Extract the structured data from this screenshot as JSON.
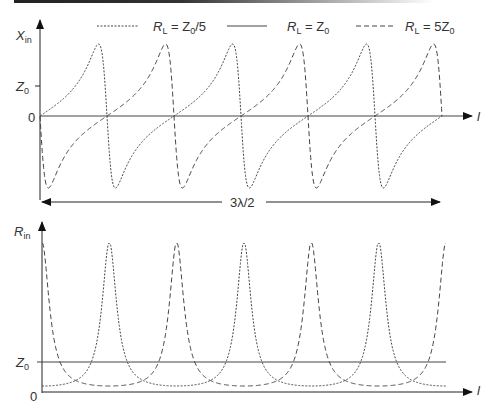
{
  "chart_data": [
    {
      "type": "line",
      "title": "",
      "ylabel": "X_in",
      "ylabel_main": "X",
      "ylabel_sub": "in",
      "xlabel": "l",
      "y_ticks": [
        "Z0",
        "0"
      ],
      "span_label": "3λ/2",
      "legend_position": "top",
      "series": [
        {
          "name": "R_L = Z0/5",
          "style": "dotted",
          "shape": "tan-like: rises from 0, peaks then plunges to negative minimum, repeating every λ/4... period λ/2",
          "peak": 2.4,
          "min": -2.4,
          "periods": 3
        },
        {
          "name": "R_L = Z0",
          "style": "solid",
          "value": 0
        },
        {
          "name": "R_L = 5Z0",
          "style": "dashed",
          "shape": "starts at 0, dips to negative minimum, rises gradually to positive peak, plunges; period λ/2",
          "peak": 2.4,
          "min": -2.4,
          "periods": 3
        }
      ]
    },
    {
      "type": "line",
      "title": "",
      "ylabel": "R_in",
      "ylabel_main": "R",
      "ylabel_sub": "in",
      "xlabel": "l",
      "y_ticks": [
        "Z0",
        "0"
      ],
      "series": [
        {
          "name": "R_L = Z0/5",
          "style": "dotted",
          "min": 0.2,
          "max": 5.0,
          "periods": 3
        },
        {
          "name": "R_L = Z0",
          "style": "solid",
          "value": 1.0
        },
        {
          "name": "R_L = 5Z0",
          "style": "dashed",
          "min": 0.2,
          "max": 5.0,
          "periods": 3
        }
      ]
    }
  ],
  "legend": {
    "items": [
      {
        "label_pre": "R",
        "label_sub": "L",
        "label_post": " = Z",
        "label_sub2": "0",
        "label_tail": "/5"
      },
      {
        "label_pre": "R",
        "label_sub": "L",
        "label_post": " = Z",
        "label_sub2": "0",
        "label_tail": ""
      },
      {
        "label_pre": "R",
        "label_sub": "L",
        "label_post": " = 5Z",
        "label_sub2": "0",
        "label_tail": ""
      }
    ]
  },
  "top": {
    "y_label": "X",
    "y_label_sub": "in",
    "z0_label": "Z",
    "z0_sub": "0",
    "zero_label": "0",
    "x_label": "l",
    "span_label": "3λ/2"
  },
  "bottom": {
    "y_label": "R",
    "y_label_sub": "in",
    "z0_label": "Z",
    "z0_sub": "0",
    "zero_label": "0",
    "x_label": "l"
  }
}
